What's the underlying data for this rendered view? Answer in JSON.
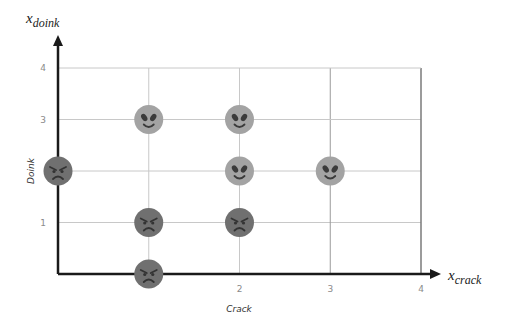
{
  "chart_data": {
    "type": "scatter",
    "title": "",
    "xlabel": "Crack",
    "ylabel": "Doink",
    "x_var_label": {
      "base": "x",
      "sub": "crack"
    },
    "y_var_label": {
      "base": "x",
      "sub": "doink"
    },
    "xlim": [
      0,
      4
    ],
    "ylim": [
      0,
      4
    ],
    "x_ticks": [
      {
        "v": 2,
        "label": "2"
      },
      {
        "v": 3,
        "label": "3"
      },
      {
        "v": 4,
        "label": "4"
      }
    ],
    "y_ticks": [
      {
        "v": 1,
        "label": "1"
      },
      {
        "v": 3,
        "label": "3"
      },
      {
        "v": 4,
        "label": "4"
      }
    ],
    "grid": true,
    "legend": null,
    "series": [
      {
        "name": "alien (happy)",
        "marker": "alien-face",
        "color": "#a3a3a3",
        "points": [
          {
            "x": 1,
            "y": 3
          },
          {
            "x": 2,
            "y": 3
          },
          {
            "x": 2,
            "y": 2
          },
          {
            "x": 3,
            "y": 2
          }
        ]
      },
      {
        "name": "angry",
        "marker": "angry-face",
        "color": "#707070",
        "points": [
          {
            "x": 0,
            "y": 2
          },
          {
            "x": 1,
            "y": 1
          },
          {
            "x": 2,
            "y": 1
          },
          {
            "x": 1,
            "y": 0
          }
        ]
      }
    ]
  },
  "colors": {
    "axis": "#1a1a1a",
    "grid": "#c8c8c8",
    "gridDark": "#7a7a7a",
    "alien": "#a3a3a3",
    "angry": "#707070",
    "feature": "#3a3a3a"
  }
}
